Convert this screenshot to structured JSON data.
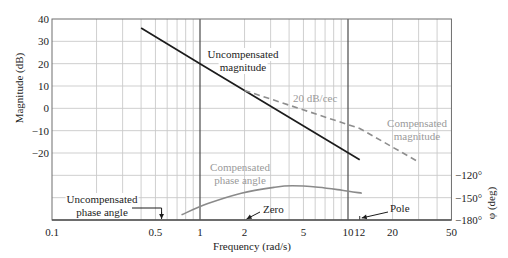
{
  "chart_data": {
    "type": "line",
    "title": "",
    "xlabel": "Frequency (rad/s)",
    "ylabel": "Magnitude (dB)",
    "ylabel_right": "φ (deg)",
    "xscale": "log",
    "xlim": [
      0.1,
      50
    ],
    "ylim": [
      -50,
      40
    ],
    "grid": true,
    "legend": null,
    "right_axis": {
      "min": -180,
      "max": -120,
      "deg_per_gridline": 30
    },
    "x_ticks": [
      {
        "value": 0.1,
        "label": "0.1"
      },
      {
        "value": 0.5,
        "label": "0.5"
      },
      {
        "value": 1,
        "label": "1"
      },
      {
        "value": 2,
        "label": "2"
      },
      {
        "value": 5,
        "label": "5"
      },
      {
        "value": 10,
        "label": "10"
      },
      {
        "value": 12,
        "label": "12"
      },
      {
        "value": 20,
        "label": "20"
      },
      {
        "value": 50,
        "label": "50"
      }
    ],
    "y_ticks": [
      {
        "value": 40,
        "label": "40"
      },
      {
        "value": 30,
        "label": "30"
      },
      {
        "value": 20,
        "label": "20"
      },
      {
        "value": 10,
        "label": "10"
      },
      {
        "value": 0,
        "label": "0"
      },
      {
        "value": -10,
        "label": "−10"
      },
      {
        "value": -20,
        "label": "−20"
      }
    ],
    "y_right_ticks": [
      {
        "value": -120,
        "label": "−120°"
      },
      {
        "value": -150,
        "label": "−150°"
      },
      {
        "value": -180,
        "label": "−180°"
      }
    ],
    "series": [
      {
        "name": "Uncompensated magnitude",
        "axis": "left",
        "style": "solid",
        "color": "#1c1c1c",
        "points": [
          [
            0.4,
            36
          ],
          [
            1,
            20
          ],
          [
            12,
            -23
          ]
        ]
      },
      {
        "name": "Compensated magnitude",
        "axis": "left",
        "style": "dashed",
        "color": "#8e8e8e",
        "points": [
          [
            2,
            8
          ],
          [
            12,
            -9
          ],
          [
            30,
            -24
          ]
        ]
      },
      {
        "name": "Compensated phase angle",
        "axis": "right",
        "style": "solid",
        "color": "#8a8a8a",
        "points": [
          [
            0.75,
            -173
          ],
          [
            1.13,
            -158
          ],
          [
            1.9,
            -144
          ],
          [
            3.2,
            -136
          ],
          [
            4.2,
            -134
          ],
          [
            6.3,
            -136
          ],
          [
            9.1,
            -140
          ],
          [
            12.4,
            -144
          ]
        ]
      },
      {
        "name": "Uncompensated phase angle",
        "axis": "right",
        "style": "solid",
        "color": "#555555",
        "points": [
          [
            0.1,
            -180
          ],
          [
            50,
            -180
          ]
        ]
      }
    ],
    "annotations": [
      {
        "id": "uncompensated-magnitude",
        "lines": [
          "Uncompensated",
          "magnitude"
        ]
      },
      {
        "id": "slope",
        "lines": [
          "20 dB/cec"
        ]
      },
      {
        "id": "compensated-magnitude",
        "lines": [
          "Compensated",
          "magnitude"
        ]
      },
      {
        "id": "compensated-phase",
        "lines": [
          "Compensated",
          "phase angle"
        ]
      },
      {
        "id": "uncompensated-phase",
        "lines": [
          "Uncompensated",
          "phase angle"
        ],
        "arrow_to": 0.55
      },
      {
        "id": "zero",
        "lines": [
          "Zero"
        ],
        "arrow_to": 2
      },
      {
        "id": "pole",
        "lines": [
          "Pole"
        ],
        "arrow_to": 12
      }
    ]
  }
}
